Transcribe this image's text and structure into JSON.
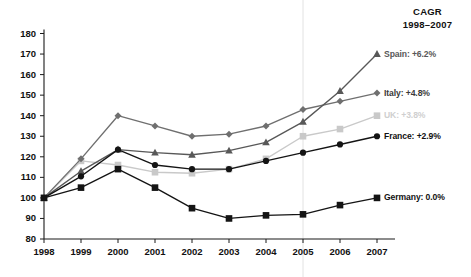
{
  "chart_data": {
    "type": "line",
    "title": "",
    "xlabel": "",
    "ylabel": "",
    "x": [
      1998,
      1999,
      2000,
      2001,
      2002,
      2003,
      2004,
      2005,
      2006,
      2007
    ],
    "xtick_labels": [
      "1998",
      "1999",
      "2000",
      "2001",
      "2002",
      "2003",
      "2004",
      "2005",
      "2006",
      "2007"
    ],
    "ytick_labels": [
      "80",
      "90",
      "100",
      "110",
      "120",
      "130",
      "140",
      "150",
      "160",
      "170",
      "180"
    ],
    "yticks": [
      80,
      90,
      100,
      110,
      120,
      130,
      140,
      150,
      160,
      170,
      180
    ],
    "ylim": [
      80,
      180
    ],
    "xlim": [
      1998,
      2007
    ],
    "grid": false,
    "vertical_reference_line_at": 2005,
    "index_base": 100,
    "legend_position": "right",
    "series": [
      {
        "name": "Spain",
        "cagr_label": "Spain: +6.2%",
        "cagr": "+6.2%",
        "color": "#585858",
        "marker": "triangle",
        "values": [
          100,
          113,
          123.5,
          122,
          121,
          123,
          127,
          137,
          152,
          170
        ]
      },
      {
        "name": "Italy",
        "cagr_label": "Italy: +4.8%",
        "cagr": "+4.8%",
        "color": "#6f6f6f",
        "marker": "diamond",
        "values": [
          100,
          119,
          140,
          135,
          130,
          131,
          135,
          143,
          147,
          151
        ]
      },
      {
        "name": "UK",
        "cagr_label": "UK: +3.8%",
        "cagr": "+3.8%",
        "color": "#c9c9c9",
        "marker": "square",
        "values": [
          100,
          118,
          116,
          112.5,
          112,
          114,
          119,
          130,
          133.5,
          140
        ]
      },
      {
        "name": "France",
        "cagr_label": "France: +2.9%",
        "cagr": "+2.9%",
        "color": "#141414",
        "marker": "circle",
        "values": [
          100,
          110.5,
          123.5,
          116,
          114,
          114,
          118,
          122,
          126,
          130
        ]
      },
      {
        "name": "Germany",
        "cagr_label": "Germany: 0.0%",
        "cagr": "0.0%",
        "color": "#141414",
        "marker": "square",
        "values": [
          100,
          105,
          114,
          105,
          95,
          90,
          91.5,
          92,
          96.5,
          100
        ]
      }
    ]
  },
  "legend": {
    "title_line1": "CAGR",
    "title_line2": "1998–2007",
    "entries": [
      {
        "label": "Spain: +6.2%",
        "color": "#585858",
        "value": 170
      },
      {
        "label": "Italy: +4.8%",
        "color": "#3a3a3a",
        "value": 151
      },
      {
        "label": "UK: +3.8%",
        "color": "#cfcfcf",
        "value": 140
      },
      {
        "label": "France: +2.9%",
        "color": "#111111",
        "value": 130
      },
      {
        "label": "Germany: 0.0%",
        "color": "#111111",
        "value": 100
      }
    ]
  }
}
